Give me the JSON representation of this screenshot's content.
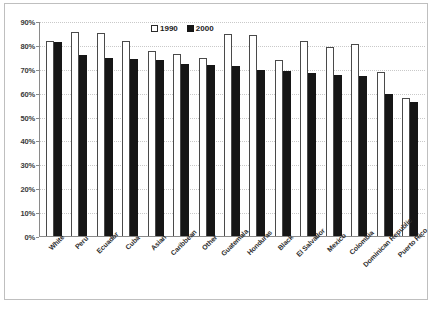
{
  "chart_data": {
    "type": "bar",
    "title": "",
    "subtitle": "",
    "xlabel": "",
    "ylabel": "",
    "ylim": [
      0,
      90
    ],
    "ytick_labels": [
      "0%",
      "10%",
      "20%",
      "30%",
      "40%",
      "50%",
      "60%",
      "70%",
      "80%",
      "90%"
    ],
    "ytick_values": [
      0,
      10,
      20,
      30,
      40,
      50,
      60,
      70,
      80,
      90
    ],
    "grid": true,
    "legend_position": "top-center",
    "categories": [
      "White",
      "Peru",
      "Ecuador",
      "Cuba",
      "Asian",
      "Caribbean",
      "Other",
      "Guatemala",
      "Honduras",
      "Black",
      "El Salvador",
      "Mexico",
      "Colombia",
      "Dominican Republic",
      "Puerto Rico"
    ],
    "series": [
      {
        "name": "1990",
        "color": "#ffffff",
        "values": [
          82,
          86,
          85.5,
          82,
          78,
          76.5,
          75,
          85,
          84.5,
          74,
          82,
          79.5,
          81,
          69,
          58
        ]
      },
      {
        "name": "2000",
        "color": "#161616",
        "values": [
          81.5,
          76,
          75,
          74.5,
          74,
          72.5,
          72,
          71.5,
          70,
          69.5,
          68.5,
          68,
          67.5,
          60,
          56.5
        ]
      }
    ]
  },
  "legend": {
    "items": [
      {
        "label": "1990",
        "swatch": "hollow-square"
      },
      {
        "label": "2000",
        "swatch": "filled-square"
      }
    ]
  }
}
